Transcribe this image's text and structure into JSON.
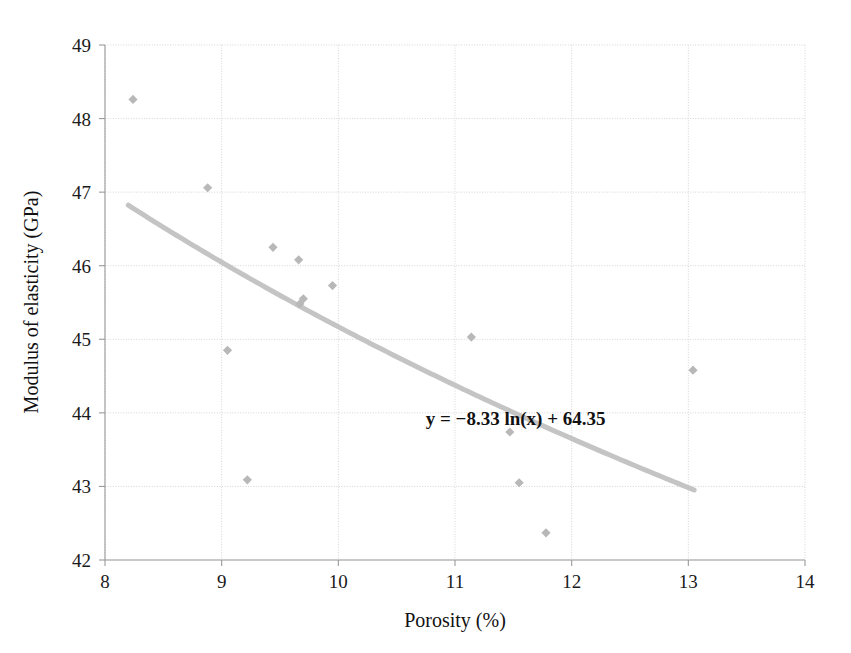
{
  "chart_data": {
    "type": "scatter",
    "title": "",
    "xlabel": "Porosity (%)",
    "ylabel": "Modulus of elasticity (GPa)",
    "xlim": [
      8,
      14
    ],
    "ylim": [
      42,
      49
    ],
    "xticks": [
      "8",
      "9",
      "10",
      "11",
      "12",
      "13",
      "14"
    ],
    "yticks": [
      "42",
      "43",
      "44",
      "45",
      "46",
      "47",
      "48",
      "49"
    ],
    "grid": true,
    "legend": "none",
    "marker": "diamond",
    "marker_color": "#b8b8b8",
    "trendline_color": "#c4c4c4",
    "grid_color": "#d5d5d5",
    "axis_color": "#9a9a9a",
    "points": [
      {
        "x": 8.24,
        "y": 48.26
      },
      {
        "x": 8.88,
        "y": 47.06
      },
      {
        "x": 9.05,
        "y": 44.85
      },
      {
        "x": 9.22,
        "y": 43.09
      },
      {
        "x": 9.44,
        "y": 46.25
      },
      {
        "x": 9.66,
        "y": 46.08
      },
      {
        "x": 9.67,
        "y": 45.48
      },
      {
        "x": 9.7,
        "y": 45.55
      },
      {
        "x": 9.95,
        "y": 45.73
      },
      {
        "x": 11.14,
        "y": 45.03
      },
      {
        "x": 11.47,
        "y": 43.74
      },
      {
        "x": 11.55,
        "y": 43.05
      },
      {
        "x": 11.78,
        "y": 42.37
      },
      {
        "x": 13.04,
        "y": 44.58
      }
    ],
    "trendline": {
      "equation": "y = −8.33 ln(x) + 64.35",
      "slope_coefficient": -8.33,
      "intercept": 64.35,
      "x_start": 8.2,
      "x_end": 13.05
    },
    "annotations": [
      {
        "text": "y = −8.33 ln(x) + 64.35",
        "x": 11.52,
        "y": 43.83
      }
    ]
  }
}
